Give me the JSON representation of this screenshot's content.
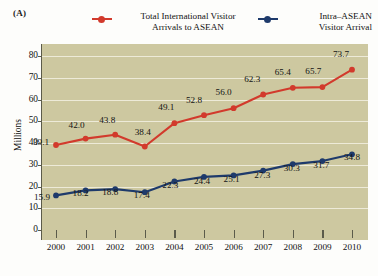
{
  "panel": {
    "label": "(A)"
  },
  "legend": {
    "items": [
      {
        "name": "total-international",
        "line1": "Total International Visitor",
        "line2": "Arrivals to ASEAN",
        "color": "#d23a2c",
        "marker": "circle-marker"
      },
      {
        "name": "intra-asean",
        "line1": "Intra–ASEAN",
        "line2": "Visitor Arrival",
        "color": "#1e3a6b",
        "marker": "circle-marker"
      }
    ]
  },
  "axis": {
    "ylabel": "Millions",
    "yticks": [
      "0",
      "10",
      "20",
      "30",
      "40",
      "50",
      "60",
      "70",
      "80"
    ],
    "xticks": [
      "2000",
      "2001",
      "2002",
      "2003",
      "2004",
      "2005",
      "2006",
      "2007",
      "2008",
      "2009",
      "2010"
    ]
  },
  "labels": {
    "total": [
      "39.1",
      "42.0",
      "43.8",
      "38.4",
      "49.1",
      "52.8",
      "56.0",
      "62.3",
      "65.4",
      "65.7",
      "73.7"
    ],
    "intra": [
      "15.9",
      "18.2",
      "18.8",
      "17.4",
      "22.3",
      "24.4",
      "25.1",
      "27.3",
      "30.3",
      "31.7",
      "34.8"
    ]
  },
  "colors": {
    "plot_background": "#cdc8a0",
    "gridline": "#f2f0e2",
    "axis": "#5b5b4a",
    "total_series": "#d23a2c",
    "intra_series": "#1e3a6b",
    "page_background": "#fdfdfb"
  },
  "chart_data": {
    "type": "line",
    "title": "",
    "subtitle": "",
    "panel_label": "(A)",
    "xlabel": "",
    "ylabel": "Millions",
    "x": [
      2000,
      2001,
      2002,
      2003,
      2004,
      2005,
      2006,
      2007,
      2008,
      2009,
      2010
    ],
    "categories": [
      "2000",
      "2001",
      "2002",
      "2003",
      "2004",
      "2005",
      "2006",
      "2007",
      "2008",
      "2009",
      "2010"
    ],
    "series": [
      {
        "name": "Total International Visitor Arrivals to ASEAN",
        "color": "#d23a2c",
        "values": [
          39.1,
          42.0,
          43.8,
          38.4,
          49.1,
          52.8,
          56.0,
          62.3,
          65.4,
          65.7,
          73.7
        ]
      },
      {
        "name": "Intra–ASEAN Visitor Arrival",
        "color": "#1e3a6b",
        "values": [
          15.9,
          18.2,
          18.8,
          17.4,
          22.3,
          24.4,
          25.1,
          27.3,
          30.3,
          31.7,
          34.8
        ]
      }
    ],
    "ylim": [
      0,
      80
    ],
    "ytick_step": 10,
    "grid": true,
    "grid_axis": "y",
    "legend_position": "top",
    "data_labels": true,
    "units": "millions"
  }
}
